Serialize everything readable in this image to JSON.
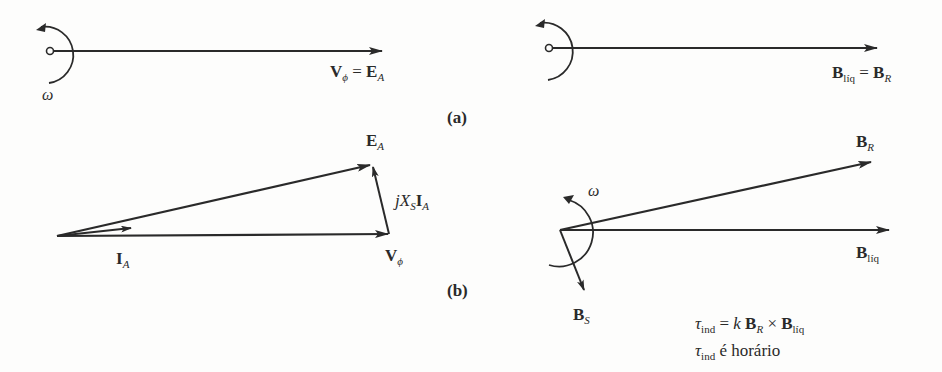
{
  "panel_a": {
    "tag": "(a)",
    "left": {
      "omega": "ω",
      "vector_label": {
        "v": "V",
        "v_sub": "ϕ",
        "eq": "=",
        "e": "E",
        "e_sub": "A"
      }
    },
    "right": {
      "vector_label": {
        "b1": "B",
        "b1_sub": "líq",
        "eq": "=",
        "b2": "B",
        "b2_sub": "R"
      }
    }
  },
  "panel_b": {
    "tag": "(b)",
    "left": {
      "ea": {
        "main": "E",
        "sub": "A"
      },
      "jxsia": {
        "j": "j",
        "x": "X",
        "x_sub": "S",
        "i": "I",
        "i_sub": "A"
      },
      "ia": {
        "main": "I",
        "sub": "A"
      },
      "vphi": {
        "main": "V",
        "sub": "ϕ"
      }
    },
    "right": {
      "omega": "ω",
      "br": {
        "main": "B",
        "sub": "R"
      },
      "bnet": {
        "main": "B",
        "sub": "líq"
      },
      "bs": {
        "main": "B",
        "sub": "S"
      },
      "eq1": {
        "tau": "τ",
        "tau_sub": "ind",
        "rest1": " = ",
        "k": "k",
        "b1": " B",
        "b1_sub": "R",
        "times": " × ",
        "b2": "B",
        "b2_sub": "líq"
      },
      "eq2": {
        "tau": "τ",
        "tau_sub": "ind",
        "text": " é horário"
      }
    }
  },
  "colors": {
    "ink": "#2a2a2a",
    "background": "#fdfdfc"
  }
}
